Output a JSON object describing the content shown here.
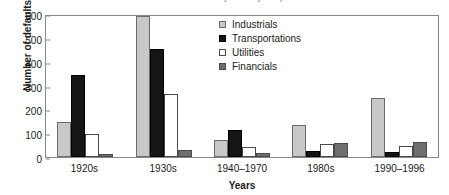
{
  "chart_data": {
    "type": "bar",
    "title": "Number of defaults by industry and period",
    "xlabel": "Years",
    "ylabel": "Number of defaults",
    "ylim": [
      0,
      600
    ],
    "yticks": [
      0,
      100,
      200,
      300,
      400,
      500,
      600
    ],
    "grid": false,
    "legend_position": "top-center-inside",
    "categories": [
      "1920s",
      "1930s",
      "1940–1970",
      "1980s",
      "1990–1996"
    ],
    "series": [
      {
        "name": "Industrials",
        "color": "#c8c8c8",
        "values": [
          145,
          590,
          72,
          135,
          248
        ]
      },
      {
        "name": "Transportations",
        "color": "#151515",
        "values": [
          345,
          455,
          112,
          25,
          23
        ]
      },
      {
        "name": "Utilities",
        "color": "#ffffff",
        "values": [
          97,
          265,
          40,
          53,
          45
        ]
      },
      {
        "name": "Financials",
        "color": "#6e6e6e",
        "values": [
          12,
          28,
          15,
          58,
          65
        ]
      }
    ]
  }
}
